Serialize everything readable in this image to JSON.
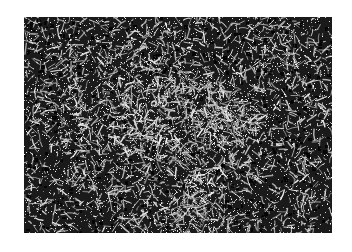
{
  "image": {
    "description": "Grayscale tangled fiber / noise network texture",
    "background_color": "#ffffff",
    "texture": {
      "x": 24,
      "y": 17,
      "width": 308,
      "height": 216,
      "base_color": "#1a1a1a",
      "stroke_color": "#f2f2f2",
      "seed": 1337,
      "stroke_count": 5200,
      "max_stroke_length": 9,
      "speckle_count": 9000
    }
  }
}
